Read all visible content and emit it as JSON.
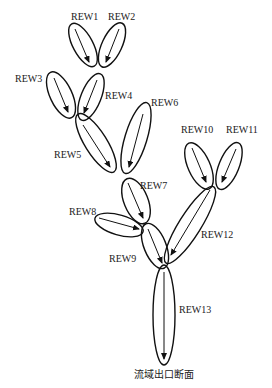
{
  "diagram": {
    "type": "river network routing diagram",
    "reaches": [
      {
        "id": "REW1",
        "label": "REW1",
        "label_pos": [
          71,
          12
        ]
      },
      {
        "id": "REW2",
        "label": "REW2",
        "label_pos": [
          108,
          12
        ]
      },
      {
        "id": "REW3",
        "label": "REW3",
        "label_pos": [
          15,
          74
        ]
      },
      {
        "id": "REW4",
        "label": "REW4",
        "label_pos": [
          105,
          91
        ]
      },
      {
        "id": "REW5",
        "label": "REW5",
        "label_pos": [
          54,
          150
        ]
      },
      {
        "id": "REW6",
        "label": "REW6",
        "label_pos": [
          151,
          98
        ]
      },
      {
        "id": "REW7",
        "label": "REW7",
        "label_pos": [
          140,
          181
        ]
      },
      {
        "id": "REW8",
        "label": "REW8",
        "label_pos": [
          69,
          207
        ]
      },
      {
        "id": "REW9",
        "label": "REW9",
        "label_pos": [
          109,
          254
        ]
      },
      {
        "id": "REW10",
        "label": "REW10",
        "label_pos": [
          181,
          125
        ]
      },
      {
        "id": "REW11",
        "label": "REW11",
        "label_pos": [
          226,
          125
        ]
      },
      {
        "id": "REW12",
        "label": "REW12",
        "label_pos": [
          201,
          230
        ]
      },
      {
        "id": "REW13",
        "label": "REW13",
        "label_pos": [
          179,
          305
        ]
      }
    ],
    "outlet_label": "流域出口断面"
  }
}
